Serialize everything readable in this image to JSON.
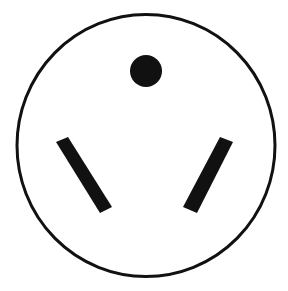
{
  "diagram": {
    "title": "Three-prong outlet receptacle face",
    "background": "#ffffff",
    "ink_color": "#111111",
    "face": {
      "shape": "circle",
      "cx": 146,
      "cy": 145.5,
      "rx": 129,
      "ry": 131,
      "stroke_width": 3,
      "label": "receptacle face outline"
    },
    "ground_hole": {
      "shape": "circle",
      "cx": 146,
      "cy": 71,
      "r": 16,
      "label": "round ground hole"
    },
    "slots": [
      {
        "label": "left angled slot",
        "points": "56,142 68,137 112,207 100,213"
      },
      {
        "label": "right angled slot",
        "points": "220,137 233,142 197,213 183,207"
      }
    ]
  }
}
